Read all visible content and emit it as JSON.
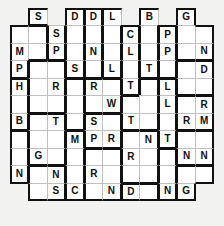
{
  "puzzle": {
    "title": "Letter Grid Puzzle",
    "type": "letter-grid",
    "columns": 11,
    "rows": 12,
    "colors": {
      "cell_background": "#ffffff",
      "page_background": "#f2f2f0",
      "thin_border": "#bfbfbf",
      "thick_border": "#111111",
      "letter_color": "#111111"
    },
    "grid": [
      [
        "",
        "S",
        "",
        "D",
        "D",
        "L",
        "",
        "B",
        "",
        "G",
        ""
      ],
      [
        "",
        "",
        "S",
        "",
        "",
        "",
        "C",
        "",
        "P",
        "",
        ""
      ],
      [
        "M",
        "",
        "P",
        "",
        "N",
        "",
        "L",
        "",
        "P",
        "",
        "N"
      ],
      [
        "P",
        "",
        "",
        "S",
        "",
        "L",
        "",
        "T",
        "",
        "",
        "D"
      ],
      [
        "H",
        "",
        "R",
        "",
        "R",
        "",
        "T",
        "",
        "L",
        "",
        ""
      ],
      [
        "",
        "",
        "",
        "",
        "",
        "W",
        "",
        "",
        "L",
        "",
        "R"
      ],
      [
        "B",
        "",
        "T",
        "",
        "S",
        "",
        "T",
        "",
        "",
        "R",
        "M"
      ],
      [
        "",
        "",
        "",
        "M",
        "P",
        "R",
        "",
        "N",
        "T",
        "",
        ""
      ],
      [
        "",
        "G",
        "",
        "",
        "",
        "",
        "R",
        "",
        "",
        "N",
        "N"
      ],
      [
        "N",
        "",
        "N",
        "",
        "R",
        "",
        "",
        "",
        "",
        "",
        ""
      ],
      [
        "",
        "",
        "S",
        "C",
        "",
        "N",
        "D",
        "",
        "N",
        "G",
        ""
      ],
      [
        "",
        "",
        "",
        "",
        "",
        "",
        "",
        "",
        "",
        "",
        ""
      ]
    ],
    "empty_cells": [
      [
        0,
        0
      ],
      [
        0,
        2
      ],
      [
        0,
        6
      ],
      [
        0,
        8
      ],
      [
        0,
        10
      ],
      [
        10,
        0
      ],
      [
        10,
        10
      ],
      [
        11,
        0
      ],
      [
        11,
        1
      ],
      [
        11,
        2
      ],
      [
        11,
        3
      ],
      [
        11,
        4
      ],
      [
        11,
        5
      ],
      [
        11,
        6
      ],
      [
        11,
        7
      ],
      [
        11,
        8
      ],
      [
        11,
        9
      ],
      [
        11,
        10
      ]
    ],
    "letters_present": [
      "S",
      "D",
      "L",
      "B",
      "G",
      "C",
      "P",
      "M",
      "N",
      "H",
      "R",
      "W",
      "T"
    ]
  }
}
